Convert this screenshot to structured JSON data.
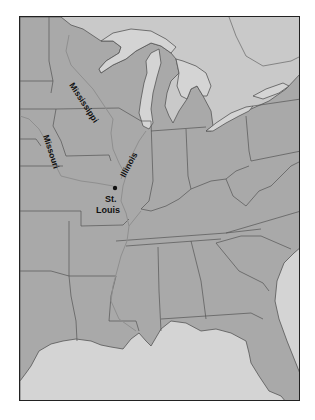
{
  "map": {
    "title": "",
    "colors": {
      "us_land": "#a9a9a9",
      "canada_land": "#c9c9c9",
      "water": "#d4d4d4",
      "border": "#555555",
      "river": "#8f8f8f",
      "frame": "#222222",
      "label": "#111111"
    },
    "labels": {
      "mississippi": "Mississippi",
      "missouri": "Missouri",
      "illinois": "Illinois",
      "city_line1": "St.",
      "city_line2": "Louis"
    },
    "markers": [
      {
        "name": "St. Louis",
        "type": "city-dot"
      }
    ],
    "rivers": [
      "Mississippi",
      "Missouri",
      "Illinois"
    ]
  }
}
